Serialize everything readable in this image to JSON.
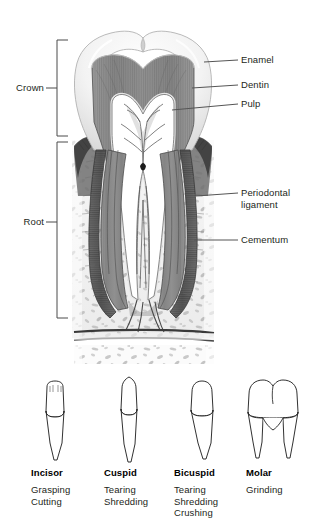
{
  "figure": {
    "colors": {
      "ink": "#231f20",
      "leader_line": "#555555",
      "bracket": "#444444",
      "enamel_fill": "#efefef",
      "enamel_edge": "#b9b9b9",
      "dentin_fill": "#8d8d8d",
      "dentin_edge": "#5a5a5a",
      "pulp_fill": "#ffffff",
      "pulp_vessel": "#4a4a4a",
      "cementum_fill": "#6f6f6f",
      "bone_fill": "#efefef",
      "bone_speck": "#b0b0b0",
      "outline": "#1a1a1a"
    }
  },
  "brackets": [
    {
      "label": "Crown",
      "id": "crown"
    },
    {
      "label": "Root",
      "id": "root"
    }
  ],
  "callouts": [
    {
      "label": "Enamel",
      "id": "enamel"
    },
    {
      "label": "Dentin",
      "id": "dentin"
    },
    {
      "label": "Pulp",
      "id": "pulp"
    },
    {
      "label": "Periodontal\nligament",
      "id": "periodontal-ligament"
    },
    {
      "label": "Cementum",
      "id": "cementum"
    }
  ],
  "tooth_types": [
    {
      "name": "Incisor",
      "functions": "Grasping\nCutting"
    },
    {
      "name": "Cuspid",
      "functions": "Tearing\nShredding"
    },
    {
      "name": "Bicuspid",
      "functions": "Tearing\nShredding\nCrushing"
    },
    {
      "name": "Molar",
      "functions": "Grinding"
    }
  ]
}
